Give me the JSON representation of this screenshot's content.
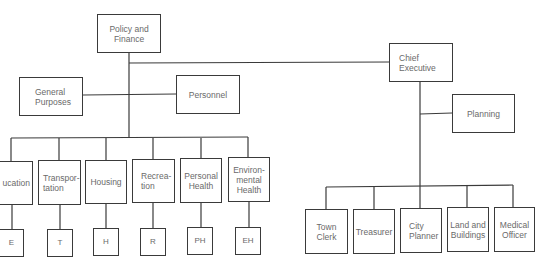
{
  "diagram": {
    "type": "organization-chart",
    "top": {
      "policy_finance": "Policy and\nFinance",
      "chief_executive": "Chief\nExecutive"
    },
    "subcommittees": {
      "general_purposes": "General\nPurposes",
      "personnel": "Personnel",
      "planning": "Planning"
    },
    "committees": [
      {
        "label": "ucation",
        "abbr": "E"
      },
      {
        "label": "Transpor-\ntation",
        "abbr": "T"
      },
      {
        "label": "Housing",
        "abbr": "H"
      },
      {
        "label": "Recrea-\ntion",
        "abbr": "R"
      },
      {
        "label": "Personal\nHealth",
        "abbr": "PH"
      },
      {
        "label": "Environ-\nmental\nHealth",
        "abbr": "EH"
      }
    ],
    "officers": [
      {
        "label": "Town\nClerk"
      },
      {
        "label": "Treasurer"
      },
      {
        "label": "City\nPlanner"
      },
      {
        "label": "Land and\nBuildings"
      },
      {
        "label": "Medical\nOfficer"
      }
    ],
    "colors": {
      "line": "#3a3a3a",
      "text": "#6a6a6a",
      "background": "#ffffff"
    }
  }
}
